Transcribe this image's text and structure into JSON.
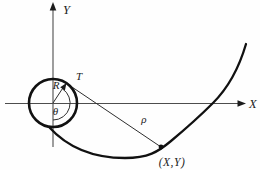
{
  "figure": {
    "labels": {
      "y_axis": "Y",
      "x_axis": "X",
      "tangent_point": "T",
      "radius": "R",
      "angle": "θ",
      "tangent_length": "ρ",
      "curve_point": "(X,Y)"
    },
    "colors": {
      "background": "#fefefe",
      "bold_stroke": "#111111",
      "thin_stroke": "#2e2e2e",
      "axis_stroke": "#4d4d4d"
    }
  }
}
